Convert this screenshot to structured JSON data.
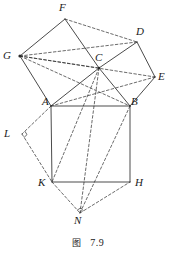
{
  "figure": {
    "caption_label": "图",
    "caption_number": "7.9",
    "line_color": "#2b2b2b",
    "label_color": "#1b1b1b",
    "background": "#ffffff",
    "width": 176,
    "height": 255
  },
  "vertices": [
    {
      "id": "F",
      "label": "F",
      "x": 65,
      "y": 19,
      "label_x": 59,
      "label_y": 2
    },
    {
      "id": "D",
      "label": "D",
      "x": 137,
      "y": 42,
      "label_x": 136,
      "label_y": 26
    },
    {
      "id": "G",
      "label": "G",
      "x": 20,
      "y": 56,
      "label_x": 3,
      "label_y": 50
    },
    {
      "id": "C",
      "label": "C",
      "x": 99,
      "y": 68,
      "label_x": 95,
      "label_y": 52
    },
    {
      "id": "E",
      "label": "E",
      "x": 155,
      "y": 77,
      "label_x": 158,
      "label_y": 71
    },
    {
      "id": "A",
      "label": "A",
      "x": 51,
      "y": 106,
      "label_x": 42,
      "label_y": 96
    },
    {
      "id": "B",
      "label": "B",
      "x": 130,
      "y": 106,
      "label_x": 131,
      "label_y": 96
    },
    {
      "id": "L",
      "label": "L",
      "x": 22,
      "y": 134,
      "label_x": 4,
      "label_y": 128
    },
    {
      "id": "K",
      "label": "K",
      "x": 52,
      "y": 182,
      "label_x": 38,
      "label_y": 177
    },
    {
      "id": "H",
      "label": "H",
      "x": 130,
      "y": 182,
      "label_x": 135,
      "label_y": 177
    },
    {
      "id": "N",
      "label": "N",
      "x": 80,
      "y": 213,
      "label_x": 74,
      "label_y": 215
    }
  ],
  "solid_edges": [
    {
      "name": "edge-A-G",
      "from": "A",
      "to": "G"
    },
    {
      "name": "edge-G-F",
      "from": "G",
      "to": "F"
    },
    {
      "name": "edge-F-C",
      "from": "F",
      "to": "C"
    },
    {
      "name": "edge-C-A",
      "from": "C",
      "to": "A"
    },
    {
      "name": "edge-C-D",
      "from": "C",
      "to": "D"
    },
    {
      "name": "edge-D-E",
      "from": "D",
      "to": "E"
    },
    {
      "name": "edge-E-B",
      "from": "E",
      "to": "B"
    },
    {
      "name": "edge-B-C",
      "from": "B",
      "to": "C"
    },
    {
      "name": "edge-A-B",
      "from": "A",
      "to": "B"
    },
    {
      "name": "edge-B-H",
      "from": "B",
      "to": "H"
    },
    {
      "name": "edge-H-K",
      "from": "H",
      "to": "K"
    },
    {
      "name": "edge-K-A",
      "from": "K",
      "to": "A"
    }
  ],
  "dashed_edges": [
    {
      "name": "dash-G-C",
      "from": "G",
      "to": "C"
    },
    {
      "name": "dash-G-D",
      "from": "G",
      "to": "D"
    },
    {
      "name": "dash-G-B",
      "from": "G",
      "to": "B"
    },
    {
      "name": "dash-G-E",
      "from": "G",
      "to": "E"
    },
    {
      "name": "dash-F-D",
      "from": "F",
      "to": "D"
    },
    {
      "name": "dash-A-E",
      "from": "A",
      "to": "E"
    },
    {
      "name": "dash-C-K",
      "from": "C",
      "to": "K"
    },
    {
      "name": "dash-C-N",
      "from": "C",
      "to": "N"
    },
    {
      "name": "dash-B-N",
      "from": "B",
      "to": "N"
    },
    {
      "name": "dash-A-L",
      "from": "A",
      "to": "L"
    },
    {
      "name": "dash-L-K",
      "from": "L",
      "to": "K"
    },
    {
      "name": "dash-K-N",
      "from": "K",
      "to": "N"
    },
    {
      "name": "dash-N-H",
      "from": "N",
      "to": "H"
    }
  ],
  "right_angle_marks": [
    {
      "name": "right-angle-at-L",
      "vertex": "L",
      "arm_a": "A",
      "arm_b": "K",
      "size": 4
    },
    {
      "name": "right-angle-at-N",
      "vertex": "N",
      "arm_a": "K",
      "arm_b": "H",
      "size": 4
    }
  ],
  "dot_markers": [
    {
      "name": "dot-at-G",
      "vertex": "G",
      "r": 1.6
    },
    {
      "name": "dot-at-C",
      "vertex": "C",
      "r": 1.2
    }
  ]
}
